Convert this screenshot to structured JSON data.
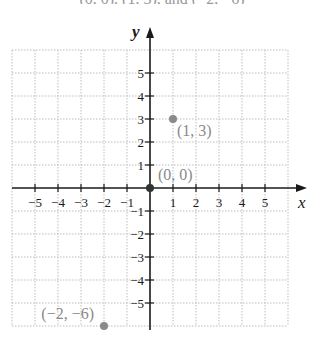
{
  "header": {
    "cut_text": "(0, 0), (1, 3), and (−2, −6)"
  },
  "chart_data": {
    "type": "scatter",
    "title": "",
    "xlabel": "x",
    "ylabel": "y",
    "xlim": [
      -6,
      6
    ],
    "ylim": [
      -6,
      6
    ],
    "grid": true,
    "x_ticks": [
      -5,
      -4,
      -3,
      -2,
      -1,
      1,
      2,
      3,
      4,
      5
    ],
    "y_ticks": [
      -5,
      -4,
      -3,
      -2,
      -1,
      1,
      2,
      3,
      4,
      5
    ],
    "x_tick_labels": [
      "−5",
      "−4",
      "−3",
      "−2",
      "−1",
      "1",
      "2",
      "3",
      "4",
      "5"
    ],
    "y_tick_labels": [
      "−5",
      "−4",
      "−3",
      "−2",
      "−1",
      "1",
      "2",
      "3",
      "4",
      "5"
    ],
    "points": [
      {
        "x": 0,
        "y": 0,
        "label": "(0, 0)"
      },
      {
        "x": 1,
        "y": 3,
        "label": "(1, 3)"
      },
      {
        "x": -2,
        "y": -6,
        "label": "(−2, −6)"
      }
    ],
    "colors": {
      "axis": "#1a1a1a",
      "grid": "#bdbdbd",
      "point": "#8a8a8a",
      "point_label": "#8a8a8a",
      "origin_point": "#333333"
    }
  }
}
